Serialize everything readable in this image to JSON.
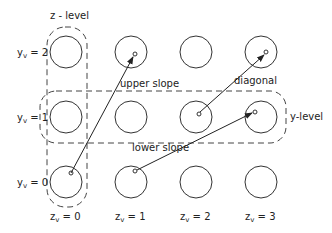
{
  "diagram": {
    "type": "grid-of-nodes",
    "labels": {
      "z_level": "z - level",
      "y_level": "y-level",
      "upper_slope": "upper slope",
      "lower_slope": "lower slope",
      "diagonal": "diagonal"
    },
    "row_labels": [
      {
        "var": "y",
        "sub": "v",
        "eq": " = 2"
      },
      {
        "var": "y",
        "sub": "v",
        "eq": " = 1"
      },
      {
        "var": "y",
        "sub": "v",
        "eq": " = 0"
      }
    ],
    "col_labels": [
      {
        "var": "z",
        "sub": "v",
        "eq": " = 0"
      },
      {
        "var": "z",
        "sub": "v",
        "eq": " = 1"
      },
      {
        "var": "z",
        "sub": "v",
        "eq": " = 2"
      },
      {
        "var": "z",
        "sub": "v",
        "eq": " = 3"
      }
    ],
    "edges": [
      {
        "name": "upper slope",
        "from": {
          "y": 0,
          "z": 0
        },
        "to": {
          "y": 2,
          "z": 1
        }
      },
      {
        "name": "lower slope",
        "from": {
          "y": 0,
          "z": 1
        },
        "to": {
          "y": 1,
          "z": 3
        }
      },
      {
        "name": "diagonal",
        "from": {
          "y": 1,
          "z": 2
        },
        "to": {
          "y": 2,
          "z": 3
        }
      }
    ],
    "colors": {
      "stroke": "#333333",
      "background": "#ffffff"
    }
  }
}
